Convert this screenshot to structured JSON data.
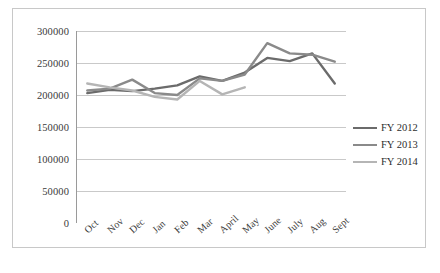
{
  "chart_data": {
    "type": "line",
    "title": "",
    "xlabel": "",
    "ylabel": "",
    "grid": true,
    "legend_position": "right",
    "ylim": [
      0,
      300000
    ],
    "yticks": [
      "0",
      "50000",
      "100000",
      "150000",
      "200000",
      "250000",
      "300000"
    ],
    "ytick_values": [
      0,
      50000,
      100000,
      150000,
      200000,
      250000,
      300000
    ],
    "categories": [
      "Oct",
      "Nov",
      "Dec",
      "Jan",
      "Feb",
      "Mar",
      "April",
      "May",
      "June",
      "July",
      "Aug",
      "Sept"
    ],
    "series": [
      {
        "name": "FY 2012",
        "color": "#6b6b6b",
        "values": [
          203000,
          208000,
          206000,
          210000,
          215000,
          229000,
          222000,
          235000,
          258000,
          253000,
          265000,
          218000
        ]
      },
      {
        "name": "FY 2013",
        "color": "#8a8a8a",
        "values": [
          207000,
          210000,
          224000,
          203000,
          200000,
          226000,
          222000,
          232000,
          281000,
          265000,
          263000,
          252000
        ]
      },
      {
        "name": "FY 2014",
        "color": "#b5b5b5",
        "values": [
          218000,
          212000,
          207000,
          197000,
          193000,
          222000,
          201000,
          212000,
          null,
          null,
          null,
          null
        ]
      }
    ]
  },
  "legend": {
    "items": [
      {
        "label": "FY 2012"
      },
      {
        "label": "FY 2013"
      },
      {
        "label": "FY 2014"
      }
    ]
  },
  "colors": {
    "axis": "#9a9a9a",
    "grid": "#c9c9c9",
    "frame": "#c8c8c8",
    "text": "#3a3a3a"
  }
}
